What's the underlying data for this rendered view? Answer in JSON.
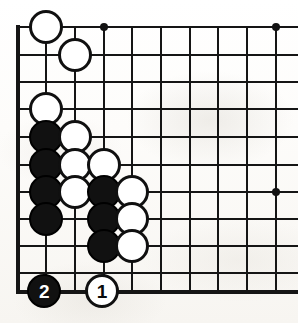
{
  "diagram": {
    "kind": "go-board-diagram",
    "board_corner": "bottom-left",
    "columns_shown": 10,
    "rows_shown": 11,
    "colors": {
      "line": "#151515",
      "black_stone": "#111111",
      "white_stone": "#ffffff",
      "stone_outline": "#101010",
      "paper": "#fbfaf7"
    }
  },
  "geometry": {
    "columns_x": [
      17.7,
      46.4,
      75.0,
      103.7,
      132.4,
      161.0,
      189.7,
      218.4,
      247.0,
      275.7
    ],
    "rows_y": [
      27.3,
      54.8,
      82.2,
      109.3,
      137.0,
      164.6,
      191.6,
      218.8,
      246.4,
      273.2,
      291.7
    ],
    "left_edge_x": 17.7,
    "top_edge_y": 27.3,
    "bottom_edge_y": 291.7,
    "stone_diameter": 34,
    "line_width": 2,
    "edge_line_width": 4
  },
  "star_points": [
    {
      "name": "star-point-top",
      "col": 4,
      "row": 1,
      "x": 103.7,
      "y": 27.3
    },
    {
      "name": "star-point-top-right",
      "col": 10,
      "row": 1,
      "x": 275.7,
      "y": 27.3
    },
    {
      "name": "star-point-right",
      "col": 10,
      "row": 7,
      "x": 275.7,
      "y": 191.6
    }
  ],
  "stones": [
    {
      "id": "w-c2-r1",
      "color": "white",
      "col": 2,
      "row": 1,
      "x": 46.4,
      "y": 27.3,
      "label": ""
    },
    {
      "id": "w-c3-r2",
      "color": "white",
      "col": 3,
      "row": 2,
      "x": 75.0,
      "y": 54.8,
      "label": ""
    },
    {
      "id": "w-c2-r3",
      "color": "white",
      "col": 2,
      "row": 3,
      "x": 46.4,
      "y": 109.3,
      "label": ""
    },
    {
      "id": "b-c2-r4",
      "color": "black",
      "col": 2,
      "row": 4,
      "x": 46.4,
      "y": 137.0,
      "label": ""
    },
    {
      "id": "w-c3-r4",
      "color": "white",
      "col": 3,
      "row": 4,
      "x": 75.0,
      "y": 137.0,
      "label": ""
    },
    {
      "id": "b-c2-r5",
      "color": "black",
      "col": 2,
      "row": 5,
      "x": 46.4,
      "y": 164.6,
      "label": ""
    },
    {
      "id": "w-c3-r5",
      "color": "white",
      "col": 3,
      "row": 5,
      "x": 75.0,
      "y": 164.6,
      "label": ""
    },
    {
      "id": "w-c4-r5",
      "color": "white",
      "col": 4,
      "row": 5,
      "x": 103.7,
      "y": 164.6,
      "label": ""
    },
    {
      "id": "b-c2-r6",
      "color": "black",
      "col": 2,
      "row": 6,
      "x": 46.4,
      "y": 191.6,
      "label": ""
    },
    {
      "id": "w-c3-r6",
      "color": "white",
      "col": 3,
      "row": 6,
      "x": 75.0,
      "y": 191.6,
      "label": ""
    },
    {
      "id": "b-c4-r6",
      "color": "black",
      "col": 4,
      "row": 6,
      "x": 103.7,
      "y": 191.6,
      "label": ""
    },
    {
      "id": "w-c5-r6",
      "color": "white",
      "col": 5,
      "row": 6,
      "x": 132.4,
      "y": 191.6,
      "label": ""
    },
    {
      "id": "b-c2-r7",
      "color": "black",
      "col": 2,
      "row": 7,
      "x": 46.4,
      "y": 218.8,
      "label": ""
    },
    {
      "id": "b-c4-r7",
      "color": "black",
      "col": 4,
      "row": 7,
      "x": 103.7,
      "y": 218.8,
      "label": ""
    },
    {
      "id": "w-c5-r7",
      "color": "white",
      "col": 5,
      "row": 7,
      "x": 132.4,
      "y": 218.8,
      "label": ""
    },
    {
      "id": "b-c4-r8",
      "color": "black",
      "col": 4,
      "row": 8,
      "x": 103.7,
      "y": 246.4,
      "label": ""
    },
    {
      "id": "w-c5-r8",
      "color": "white",
      "col": 5,
      "row": 8,
      "x": 132.4,
      "y": 246.4,
      "label": ""
    },
    {
      "id": "b-move-2",
      "color": "black",
      "col": 2,
      "row": 11,
      "x": 44.0,
      "y": 291.0,
      "label": "2"
    },
    {
      "id": "w-move-1",
      "color": "white",
      "col": 4,
      "row": 11,
      "x": 101.7,
      "y": 291.0,
      "label": "1"
    }
  ],
  "move_markers": {
    "move_1_label": "1",
    "move_1_color": "white",
    "move_2_label": "2",
    "move_2_color": "black"
  }
}
